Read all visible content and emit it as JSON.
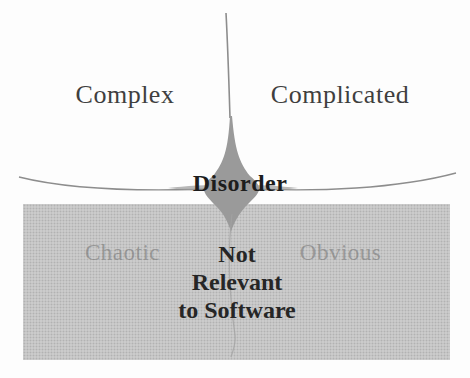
{
  "diagram": {
    "quadrants": {
      "top_left": "Complex",
      "top_right": "Complicated",
      "bottom_left": "Chaotic",
      "bottom_right": "Obvious",
      "center": "Disorder"
    },
    "overlay": {
      "line1": "Not",
      "line2": "Relevant",
      "line3": "to Software"
    },
    "colors": {
      "background": "#fdfdfd",
      "shaded_region": "#cbcbcb",
      "curve": "#8d8d8d",
      "disorder_blob": "#9a9a9a",
      "label_dark": "#3f3f3f",
      "label_faded": "#a4a4a4",
      "overlay_text": "#262626"
    }
  }
}
